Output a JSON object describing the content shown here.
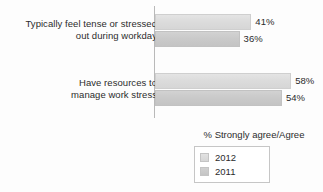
{
  "chart_data": {
    "type": "bar",
    "orientation": "horizontal",
    "title": "",
    "subtitle": "",
    "xlabel": "",
    "ylabel": "",
    "legend_title": "% Strongly agree/Agree",
    "legend_position": "bottom-right",
    "grid": false,
    "axis_visible": "vertical-category-axis-only",
    "xlim": [
      0,
      100
    ],
    "value_suffix": "%",
    "categories": [
      "Typically feel tense or stressed out during workday",
      "Have resources to manage work stress"
    ],
    "series": [
      {
        "name": "2012",
        "color": "#dcdcdc",
        "values": [
          41,
          36
        ]
      },
      {
        "name": "2011",
        "color": "#c9c9c9",
        "values": [
          36,
          54
        ]
      }
    ],
    "bars": [
      {
        "category_index": 0,
        "series": "2012",
        "value": 41,
        "label": "41%"
      },
      {
        "category_index": 0,
        "series": "2011",
        "value": 36,
        "label": "36%"
      },
      {
        "category_index": 1,
        "series": "2012",
        "value": 58,
        "label": "58%"
      },
      {
        "category_index": 1,
        "series": "2011",
        "value": 54,
        "label": "54%"
      }
    ]
  },
  "labels": {
    "category_1_line_1": "Typically feel tense or stressed",
    "category_1_line_2": "out during workday",
    "category_2_line_1": "Have resources to",
    "category_2_line_2": "manage work stress"
  },
  "values": {
    "g1_2012": "41%",
    "g1_2011": "36%",
    "g2_2012": "58%",
    "g2_2011": "54%"
  },
  "legend": {
    "title": "% Strongly agree/Agree",
    "items": [
      {
        "label": "2012"
      },
      {
        "label": "2011"
      }
    ]
  },
  "colors": {
    "series_2012": "#dcdcdc",
    "series_2011": "#c9c9c9",
    "axis": "#b9b9b9",
    "text": "#2b2b2b",
    "background": "#fdfdfd"
  }
}
